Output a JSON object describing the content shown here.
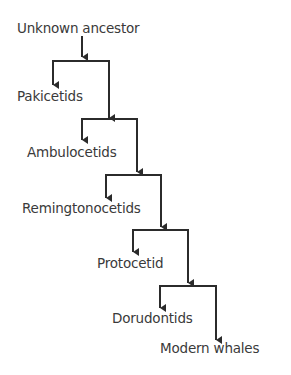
{
  "diagram": {
    "nodes": [
      {
        "id": "ancestor",
        "label": "Unknown ancestor"
      },
      {
        "id": "pakicetids",
        "label": "Pakicetids"
      },
      {
        "id": "ambulocetids",
        "label": "Ambulocetids"
      },
      {
        "id": "remingtonocetids",
        "label": "Remingtonocetids"
      },
      {
        "id": "protocetid",
        "label": "Protocetid"
      },
      {
        "id": "dorudontids",
        "label": "Dorudontids"
      },
      {
        "id": "modern",
        "label": "Modern whales"
      }
    ],
    "line_color": "#2b2b2b",
    "text_color": "#3a3a3a"
  }
}
